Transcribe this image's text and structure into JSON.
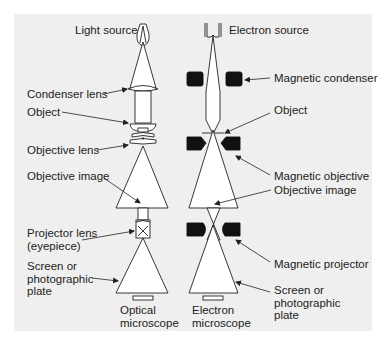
{
  "figure": {
    "type": "comparison-diagram",
    "panel_background": "#efefef",
    "line_color": "#222222"
  },
  "optical": {
    "caption": "Optical\nmicroscope",
    "labels": {
      "light_source": "Light source",
      "condenser_lens": "Condenser lens",
      "object": "Object",
      "objective_lens": "Objective lens",
      "objective_image": "Objective image",
      "projector_lens": "Projector lens\n(eyepiece)",
      "screen": "Screen or\nphotographic\nplate"
    }
  },
  "electron": {
    "caption": "Electron\nmicroscope",
    "labels": {
      "electron_source": "Electron source",
      "magnetic_condenser": "Magnetic condenser",
      "object": "Object",
      "magnetic_objective": "Magnetic objective",
      "objective_image": "Objective image",
      "magnetic_projector": "Magnetic projector",
      "screen": "Screen or\nphotographic\nplate"
    }
  }
}
